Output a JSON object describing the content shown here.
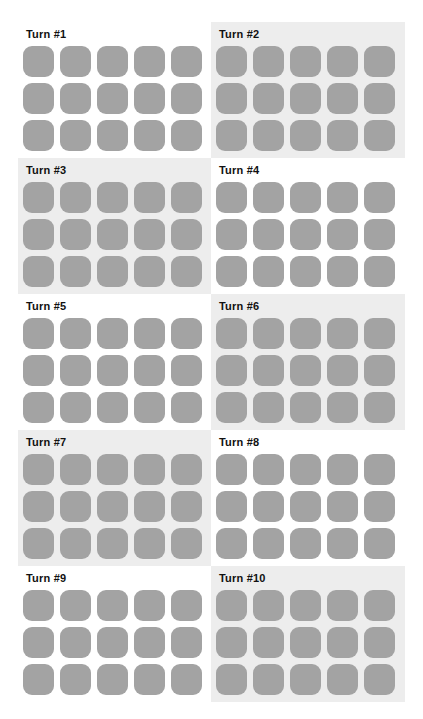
{
  "colors": {
    "tile": "#a3a3a3",
    "panel_gray": "#ededed",
    "panel_white": "#ffffff",
    "title": "#111111"
  },
  "grid": {
    "rows_per_panel": 3,
    "cols_per_panel": 5
  },
  "panels": [
    {
      "title": "Turn #1",
      "background": "white"
    },
    {
      "title": "Turn #2",
      "background": "gray"
    },
    {
      "title": "Turn #3",
      "background": "gray"
    },
    {
      "title": "Turn #4",
      "background": "white"
    },
    {
      "title": "Turn #5",
      "background": "white"
    },
    {
      "title": "Turn #6",
      "background": "gray"
    },
    {
      "title": "Turn #7",
      "background": "gray"
    },
    {
      "title": "Turn #8",
      "background": "white"
    },
    {
      "title": "Turn #9",
      "background": "white"
    },
    {
      "title": "Turn #10",
      "background": "gray"
    }
  ]
}
